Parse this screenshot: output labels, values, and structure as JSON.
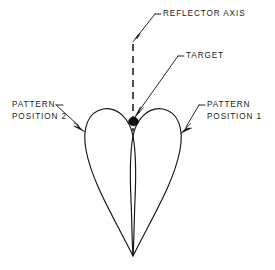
{
  "figure": {
    "background_color": "#ffffff",
    "line_color": "#141414",
    "text_color": "#1b1b1b"
  },
  "labels": {
    "reflector_axis": "REFLECTOR AXIS",
    "target": "TARGET",
    "pattern_position_2_line1": "PATTERN",
    "pattern_position_2_line2": "POSITION 2",
    "pattern_position_1_line1": "PATTERN",
    "pattern_position_1_line2": "POSITION 1"
  },
  "geometry": {
    "origin": {
      "x": 133,
      "y": 256
    },
    "axis_top": {
      "x": 133,
      "y": 42
    },
    "axis_bottom": {
      "x": 133,
      "y": 130
    },
    "target_point": {
      "x": 133.5,
      "y": 121
    },
    "target_dot_radius": 4.6,
    "lobe_crossing": {
      "x": 133,
      "y": 157
    },
    "left_lobe": {
      "apex_x": 109,
      "apex_y": 110,
      "outer_extent_x": 85,
      "outer_extent_y": 142
    },
    "right_lobe": {
      "apex_x": 157,
      "apex_y": 110,
      "outer_extent_x": 180,
      "outer_extent_y": 140
    }
  },
  "annotations": {
    "reflector_axis_leader": {
      "text_x": 163,
      "text_y": 14,
      "tick_x1": 155,
      "tick_x2": 161,
      "elbow_x": 155,
      "arrow_x": 133,
      "arrow_y": 41
    },
    "target_leader": {
      "text_x": 186,
      "text_y": 56,
      "tick_x1": 178,
      "tick_x2": 184,
      "elbow_x": 178,
      "arrow_x": 135,
      "arrow_y": 114
    },
    "pattern_2_leader": {
      "text_x": 12,
      "text_y1": 105,
      "text_y2": 117,
      "tick_x1": 56,
      "tick_x2": 64,
      "arrow_x": 84,
      "arrow_y": 131
    },
    "pattern_1_leader": {
      "text_x": 207,
      "text_y1": 105,
      "text_y2": 117,
      "tick_x1": 199,
      "tick_x2": 205,
      "arrow_x": 181,
      "arrow_y": 132
    }
  }
}
